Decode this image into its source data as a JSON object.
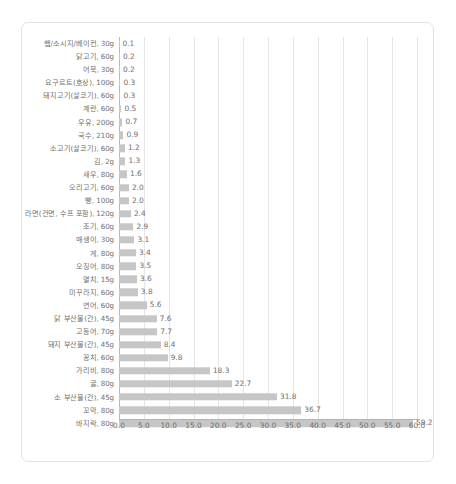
{
  "chart_data": {
    "type": "bar",
    "orientation": "horizontal",
    "title": "",
    "subtitle": "",
    "xlabel": "",
    "ylabel": "",
    "xlim": [
      0.0,
      60.0
    ],
    "xticks": [
      "0.0",
      "5.0",
      "10.0",
      "15.0",
      "20.0",
      "25.0",
      "30.0",
      "35.0",
      "40.0",
      "45.0",
      "50.0",
      "55.0",
      "60.0"
    ],
    "xtick_values": [
      0,
      5,
      10,
      15,
      20,
      25,
      30,
      35,
      40,
      45,
      50,
      55,
      60
    ],
    "grid": true,
    "legend": null,
    "bar_color": "#c6c6c6",
    "text_color": "#6f6f6f",
    "show_value_labels": true,
    "categories": [
      "햄/소시지/베이컨, 30g",
      "닭고기, 60g",
      "어묵, 30g",
      "요구르트(호상), 100g",
      "돼지고기(살코기), 60g",
      "계란, 60g",
      "우유, 200g",
      "국수, 210g",
      "소고기(살코기), 60g",
      "김, 2g",
      "새우, 80g",
      "오리고기, 60g",
      "빵, 100g",
      "라면(건면, 수프 포함), 120g",
      "조기, 60g",
      "매생이, 30g",
      "게, 80g",
      "오징어, 80g",
      "멸치, 15g",
      "미꾸라지, 60g",
      "연어, 60g",
      "닭 부산물(간), 45g",
      "고등어, 70g",
      "돼지 부산물(간), 45g",
      "꽁치, 60g",
      "가리비, 80g",
      "굴, 80g",
      "소 부산물(간), 45g",
      "꼬막, 80g",
      "바지락, 80g"
    ],
    "values": [
      0.1,
      0.2,
      0.2,
      0.3,
      0.3,
      0.5,
      0.7,
      0.9,
      1.2,
      1.3,
      1.6,
      2.0,
      2.0,
      2.4,
      2.9,
      3.1,
      3.4,
      3.5,
      3.6,
      3.8,
      5.6,
      7.6,
      7.7,
      8.4,
      9.8,
      18.3,
      22.7,
      31.8,
      36.7,
      59.2
    ],
    "value_labels": [
      "0.1",
      "0.2",
      "0.2",
      "0.3",
      "0.3",
      "0.5",
      "0.7",
      "0.9",
      "1.2",
      "1.3",
      "1.6",
      "2.0",
      "2.0",
      "2.4",
      "2.9",
      "3.1",
      "3.4",
      "3.5",
      "3.6",
      "3.8",
      "5.6",
      "7.6",
      "7.7",
      "8.4",
      "9.8",
      "18.3",
      "22.7",
      "31.8",
      "36.7",
      "59.2"
    ]
  }
}
